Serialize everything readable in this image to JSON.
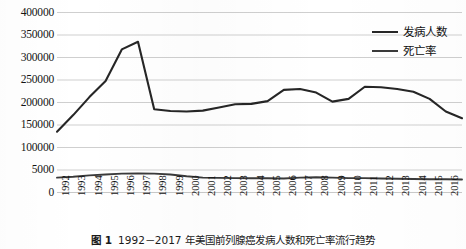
{
  "figure": {
    "caption_number": "图 1",
    "caption_text": "1992－2017 年美国前列腺癌发病人数和死亡率流行趋势"
  },
  "legend": {
    "position": "top-right",
    "items": [
      {
        "label": "发病人数",
        "color": "#262626"
      },
      {
        "label": "死亡率",
        "color": "#3a3a3a"
      }
    ]
  },
  "chart_data": {
    "type": "line",
    "title": "",
    "subtitle": "",
    "xlabel": "",
    "ylabel": "",
    "grid": true,
    "legend_position": "top-right",
    "ylim": [
      0,
      400000
    ],
    "ytick_labels": [
      "400000",
      "350000",
      "300000",
      "250000",
      "200000",
      "150000",
      "100000",
      "5000",
      "0"
    ],
    "ytick_values": [
      400000,
      350000,
      300000,
      250000,
      200000,
      150000,
      100000,
      50000,
      0
    ],
    "categories": [
      "1992",
      "1993",
      "1994",
      "1995",
      "1996",
      "1997",
      "1998",
      "1999",
      "2000",
      "2001",
      "2002",
      "2003",
      "2004",
      "2005",
      "2006",
      "2007",
      "2008",
      "2009",
      "2010",
      "2011",
      "2012",
      "2013",
      "2014",
      "2015",
      "2016",
      "2017"
    ],
    "series": [
      {
        "name": "发病人数",
        "color": "#262626",
        "values": [
          135000,
          172000,
          212000,
          248000,
          318000,
          335000,
          185000,
          181000,
          180000,
          182000,
          189000,
          196000,
          197000,
          203000,
          228000,
          230000,
          222000,
          202000,
          208000,
          235000,
          234000,
          230000,
          224000,
          208000,
          180000,
          165000
        ]
      },
      {
        "name": "死亡率",
        "color": "#3a3a3a",
        "values": [
          33000,
          35000,
          38000,
          40000,
          42000,
          42500,
          42000,
          40000,
          36000,
          33000,
          32500,
          32000,
          31500,
          31500,
          31000,
          33000,
          34000,
          33000,
          32000,
          32000,
          31000,
          30500,
          30000,
          29500,
          29500,
          29000
        ]
      }
    ]
  }
}
